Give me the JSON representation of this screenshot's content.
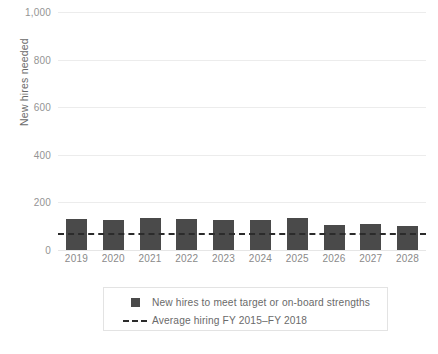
{
  "chart_data": {
    "type": "bar",
    "title": "",
    "xlabel": "",
    "ylabel": "New hires needed",
    "categories": [
      "2019",
      "2020",
      "2021",
      "2022",
      "2023",
      "2024",
      "2025",
      "2026",
      "2027",
      "2028"
    ],
    "values": [
      130,
      128,
      135,
      132,
      128,
      125,
      133,
      105,
      110,
      100
    ],
    "series": [
      {
        "name": "New hires to meet target or on-board strengths",
        "type": "bar",
        "color": "#4a4a4a",
        "values": [
          130,
          128,
          135,
          132,
          128,
          125,
          133,
          105,
          110,
          100
        ]
      },
      {
        "name": "Average hiring FY 2015–FY 2018",
        "type": "line",
        "style": "dashed",
        "color": "#2b2b2b",
        "value": 72
      }
    ],
    "ylim": [
      0,
      1000
    ],
    "yticks": [
      0,
      200,
      400,
      600,
      800,
      1000
    ],
    "ytick_labels": [
      "0",
      "200",
      "400",
      "600",
      "800",
      "1,000"
    ],
    "grid": true,
    "grid_axis": "y",
    "legend_position": "bottom"
  },
  "axes": {
    "y_title": "New hires needed",
    "y_ticks": [
      {
        "value": 1000,
        "label": "1,000"
      },
      {
        "value": 800,
        "label": "800"
      },
      {
        "value": 600,
        "label": "600"
      },
      {
        "value": 400,
        "label": "400"
      },
      {
        "value": 200,
        "label": "200"
      },
      {
        "value": 0,
        "label": "0"
      }
    ],
    "x_ticks": [
      "2019",
      "2020",
      "2021",
      "2022",
      "2023",
      "2024",
      "2025",
      "2026",
      "2027",
      "2028"
    ]
  },
  "legend": {
    "items": [
      {
        "marker": "square-swatch",
        "label": "New hires to meet target or on-board strengths"
      },
      {
        "marker": "dashed-line-swatch",
        "label": "Average hiring FY 2015–FY 2018"
      }
    ]
  },
  "colors": {
    "bar": "#4a4a4a",
    "average_line": "#2b2b2b",
    "gridline": "#ececec",
    "tick_text": "#8a8a8a",
    "legend_border": "#e3e3e3",
    "background": "#ffffff"
  }
}
